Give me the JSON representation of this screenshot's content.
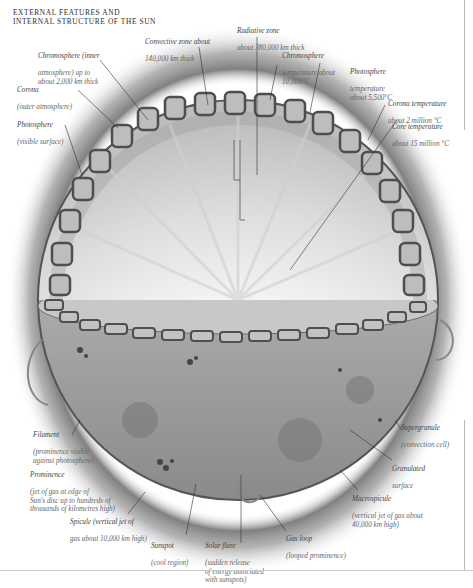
{
  "title": {
    "line1": "External features and",
    "line2": "internal structure of the sun"
  },
  "diagram": {
    "colors": {
      "background": "#ffffff",
      "corona_glow": "#8a8a8a",
      "surface": "#b9b9b9",
      "cell_outline": "#5a5a5a",
      "core": "#ffffff",
      "leader_line": "#333333"
    }
  },
  "labels": {
    "chromosphere": {
      "head": "Chromosphere (inner",
      "sub": "atmosphere) up to\nabout 2,000 km thick"
    },
    "corona": {
      "head": "Corona",
      "sub": "(outer atmosphere)"
    },
    "photosphere": {
      "head": "Photosphere",
      "sub": "(visible surface)"
    },
    "convective_zone": {
      "head": "Convective zone about",
      "sub": "140,000 km thick"
    },
    "radiative_zone": {
      "head": "Radiative zone",
      "sub": "about 380,000 km thick"
    },
    "chromosphere_temp": {
      "head": "Chromosphere",
      "sub": "temperature about\n10,000°C"
    },
    "photosphere_temp": {
      "head": "Photosphere",
      "sub": "temperature\nabout 5,500°C"
    },
    "corona_temp": {
      "head": "Corona temperature",
      "sub": "about 2 million °C"
    },
    "core_temp": {
      "head": "Core temperature",
      "sub": "about 15 million °C"
    },
    "filament": {
      "head": "Filament",
      "sub": "(prominence visible\nagainst photosphere)"
    },
    "prominence": {
      "head": "Prominence",
      "sub": "(jet of gas at edge of\nSun's disc up to hundreds of\nthousands of kilometres high)"
    },
    "spicule": {
      "head": "Spicule (vertical jet of",
      "sub": "gas about 10,000 km high)"
    },
    "sunspot": {
      "head": "Sunspot",
      "sub": "(cool region)"
    },
    "solar_flare": {
      "head": "Solar flare",
      "sub": "(sudden release\nof energy associated\nwith sunspots)"
    },
    "gas_loop": {
      "head": "Gas loop",
      "sub": "(looped prominence)"
    },
    "macrospicule": {
      "head": "Macrospicule",
      "sub": "(vertical jet of gas about\n40,000 km high)"
    },
    "granulated_surface": {
      "head": "Granulated",
      "sub": "surface"
    },
    "supergranule": {
      "head": "Supergranule",
      "sub": "(convection cell)"
    }
  }
}
